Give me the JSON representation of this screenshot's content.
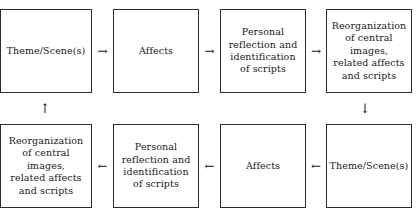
{
  "diagram": {
    "type": "flowchart",
    "colors": {
      "background": "#ffffff",
      "box_border": "#2b2b2b",
      "text": "#1a1a1a",
      "arrow": "#1a1a1a"
    },
    "top_row": {
      "nodes": [
        {
          "id": "theme-scenes-top",
          "label": "Theme/Scene(s)"
        },
        {
          "id": "affects-top",
          "label": "Affects"
        },
        {
          "id": "personal-reflection-top",
          "label": "Personal\nreflection and\nidentification\nof scripts"
        },
        {
          "id": "reorganization-top",
          "label": "Reorganization\nof central\nimages,\nrelated affects\nand scripts"
        }
      ],
      "connectors": [
        {
          "id": "arrow-theme-to-affects-top",
          "glyph": "→",
          "direction": "right"
        },
        {
          "id": "arrow-affects-to-reflection-top",
          "glyph": "→",
          "direction": "right"
        },
        {
          "id": "arrow-reflection-to-reorg-top",
          "glyph": "→",
          "direction": "right"
        }
      ]
    },
    "bottom_row": {
      "nodes": [
        {
          "id": "reorganization-bottom",
          "label": "Reorganization\nof central\nimages,\nrelated affects\nand scripts"
        },
        {
          "id": "personal-reflection-bottom",
          "label": "Personal\nreflection and\nidentification\nof scripts"
        },
        {
          "id": "affects-bottom",
          "label": "Affects"
        },
        {
          "id": "theme-scenes-bottom",
          "label": "Theme/Scene(s)"
        }
      ],
      "connectors": [
        {
          "id": "arrow-reflection-to-reorg-bottom",
          "glyph": "←",
          "direction": "left"
        },
        {
          "id": "arrow-affects-to-reflection-bottom",
          "glyph": "←",
          "direction": "left"
        },
        {
          "id": "arrow-theme-to-affects-bottom",
          "glyph": "←",
          "direction": "left"
        }
      ]
    },
    "vertical_connectors": [
      {
        "id": "arrow-down-right",
        "glyph": "↓",
        "direction": "down"
      },
      {
        "id": "arrow-up-left",
        "glyph": "↑",
        "direction": "up"
      }
    ]
  }
}
